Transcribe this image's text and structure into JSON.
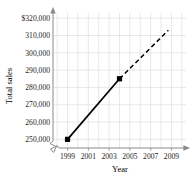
{
  "chart_data": {
    "type": "line",
    "title": "",
    "xlabel": "Year",
    "ylabel": "Total sales",
    "xlim": [
      1997.6,
      2010.4
    ],
    "ylim": [
      245000,
      323000
    ],
    "grid": true,
    "legend": false,
    "axis_break": {
      "x": true,
      "y": true
    },
    "xticks": [
      "1999",
      "2001",
      "2003",
      "2005",
      "2007",
      "2009"
    ],
    "xtick_values": [
      1999,
      2001,
      2003,
      2005,
      2007,
      2009
    ],
    "yticks": [
      "$320,000",
      "310,000",
      "300,000",
      "290,000",
      "280,000",
      "270,000",
      "260,000",
      "250,000"
    ],
    "ytick_values": [
      320000,
      310000,
      300000,
      290000,
      280000,
      270000,
      260000,
      250000
    ],
    "series": [
      {
        "name": "Total sales",
        "style": "solid",
        "marker": "square",
        "x": [
          1999,
          2004
        ],
        "y": [
          250000,
          285000
        ],
        "point_labels": [
          "",
          ""
        ]
      },
      {
        "name": "Projection",
        "style": "dashed",
        "marker": "none",
        "x": [
          2004,
          2008.7
        ],
        "y": [
          285000,
          313000
        ],
        "point_labels": [
          "",
          ""
        ]
      }
    ]
  },
  "clipped_header": "",
  "colors": {
    "axis": "#8a8a8a",
    "grid": "#e2e2e2",
    "data": "#000000",
    "text": "#1a1a1a"
  }
}
